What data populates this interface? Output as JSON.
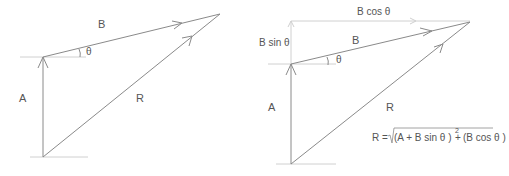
{
  "colors": {
    "line": "#8a8a8a",
    "guide": "#cfcfcf",
    "text": "#555555"
  },
  "left_diagram": {
    "labels": {
      "A": "A",
      "B": "B",
      "R": "R",
      "theta": "θ"
    }
  },
  "right_diagram": {
    "labels": {
      "A": "A",
      "B": "B",
      "R": "R",
      "theta": "θ",
      "b_cos": "B cos θ",
      "b_sin": "B sin θ"
    },
    "formula": {
      "lhs": "R =",
      "term1": "(A + B sin θ )",
      "exp1": "2",
      "plus": "+",
      "term2": "(B cos θ )",
      "exp2": "2"
    }
  }
}
